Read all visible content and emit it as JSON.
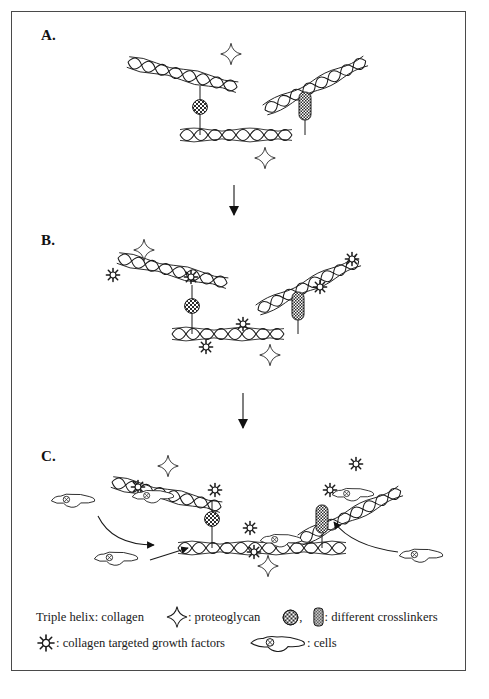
{
  "figure": {
    "panels": [
      {
        "id": "A",
        "label": "A."
      },
      {
        "id": "B",
        "label": "B."
      },
      {
        "id": "C",
        "label": "C."
      }
    ],
    "flow_arrows": [
      {
        "name": "arrow-a-to-b",
        "from_panel": "A",
        "to_panel": "B"
      },
      {
        "name": "arrow-b-to-c",
        "from_panel": "B",
        "to_panel": "C"
      }
    ]
  },
  "legend": {
    "line1": {
      "collagen_label": "Triple helix: collagen",
      "proteoglycan_sym": "proteoglycan-star-icon",
      "proteoglycan_label": ": proteoglycan",
      "crosslinker_round_sym": "crosslinker-round-icon",
      "crosslinker_separator": ",",
      "crosslinker_bar_sym": "crosslinker-bar-icon",
      "crosslinkers_label": ": different crosslinkers"
    },
    "line2": {
      "growth_factor_sym": "growth-factor-icon",
      "growth_factor_label": ": collagen targeted growth factors",
      "cell_sym": "cell-icon",
      "cells_label": ": cells"
    }
  },
  "colors": {
    "ink": "#1a1a1a",
    "border": "#4a4a4a",
    "fill": "#ffffff",
    "hatch": "#2b2b2b"
  },
  "elements": {
    "helix_name": "collagen-triple-helix",
    "star_name": "proteoglycan-star-icon",
    "round_crosslinker_name": "crosslinker-round-icon",
    "bar_crosslinker_name": "crosslinker-bar-icon",
    "growth_factor_name": "growth-factor-icon",
    "cell_name": "cell-icon",
    "migration_arrow_name": "cell-migration-arrow"
  }
}
